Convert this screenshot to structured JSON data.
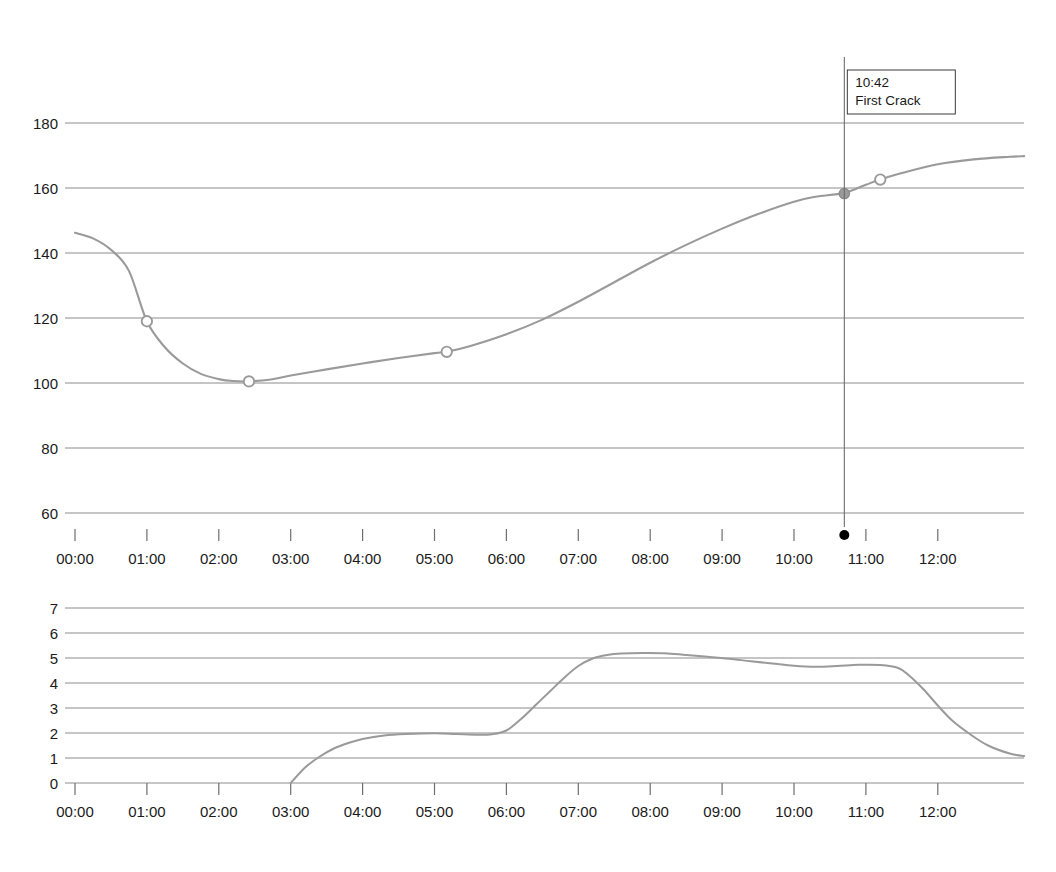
{
  "chart_data": [
    {
      "id": "bean-temperature",
      "type": "line",
      "title": "",
      "xlabel": "",
      "ylabel": "",
      "xlim": [
        0,
        13.2
      ],
      "ylim": [
        55,
        186
      ],
      "yticks": [
        60,
        80,
        100,
        120,
        140,
        160,
        180
      ],
      "ytick_labels": [
        "60",
        "80",
        "100",
        "120",
        "140",
        "160",
        "180"
      ],
      "xticks": [
        0,
        1,
        2,
        3,
        4,
        5,
        6,
        7,
        8,
        9,
        10,
        11,
        12
      ],
      "xtick_labels": [
        "00:00",
        "01:00",
        "02:00",
        "03:00",
        "04:00",
        "05:00",
        "06:00",
        "07:00",
        "08:00",
        "09:00",
        "10:00",
        "11:00",
        "12:00"
      ],
      "grid": true,
      "line_color": "#9a9a9a",
      "series": [
        {
          "name": "Bean Temperature",
          "x": [
            0.0,
            0.25,
            0.5,
            0.75,
            1.0,
            1.25,
            1.5,
            1.75,
            2.0,
            2.2,
            2.42,
            2.7,
            3.0,
            3.5,
            4.0,
            4.5,
            5.0,
            5.17,
            5.5,
            6.0,
            6.5,
            7.0,
            7.5,
            8.0,
            8.5,
            9.0,
            9.5,
            10.0,
            10.3,
            10.7,
            11.0,
            11.2,
            11.5,
            12.0,
            12.5,
            13.0,
            13.2
          ],
          "y": [
            146.2,
            144.5,
            141.0,
            134.5,
            119.0,
            111.0,
            106.0,
            102.8,
            101.2,
            100.6,
            100.5,
            101.0,
            102.3,
            104.2,
            106.0,
            107.7,
            109.2,
            109.6,
            111.4,
            115.0,
            119.5,
            125.0,
            131.0,
            137.0,
            142.5,
            147.5,
            152.0,
            155.8,
            157.3,
            158.5,
            161.0,
            162.6,
            164.6,
            167.3,
            168.8,
            169.6,
            169.8
          ]
        }
      ],
      "markers": [
        {
          "name": "dry-end-marker",
          "x": 1.0,
          "y": 119.0,
          "style": "open-circle"
        },
        {
          "name": "turning-point-marker",
          "x": 2.42,
          "y": 100.5,
          "style": "open-circle"
        },
        {
          "name": "mid-marker",
          "x": 5.17,
          "y": 109.6,
          "style": "open-circle"
        },
        {
          "name": "first-crack-marker",
          "x": 10.7,
          "y": 158.3,
          "style": "filled-circle"
        },
        {
          "name": "post-crack-marker",
          "x": 11.2,
          "y": 162.6,
          "style": "open-circle"
        }
      ],
      "annotations": [
        {
          "name": "first-crack-annotation",
          "time_label": "10:42",
          "event_label": "First Crack",
          "x": 10.7,
          "axis_dot": true
        }
      ]
    },
    {
      "id": "rate-of-rise",
      "type": "line",
      "title": "",
      "xlabel": "",
      "ylabel": "",
      "xlim": [
        0,
        13.2
      ],
      "ylim": [
        0,
        7
      ],
      "yticks": [
        0,
        1,
        2,
        3,
        4,
        5,
        6,
        7
      ],
      "ytick_labels": [
        "0",
        "1",
        "2",
        "3",
        "4",
        "5",
        "6",
        "7"
      ],
      "xticks": [
        0,
        1,
        2,
        3,
        4,
        5,
        6,
        7,
        8,
        9,
        10,
        11,
        12
      ],
      "xtick_labels": [
        "00:00",
        "01:00",
        "02:00",
        "03:00",
        "04:00",
        "05:00",
        "06:00",
        "07:00",
        "08:00",
        "09:00",
        "10:00",
        "11:00",
        "12:00"
      ],
      "grid": true,
      "line_color": "#9a9a9a",
      "series": [
        {
          "name": "Rate of Rise",
          "x": [
            3.0,
            3.2,
            3.4,
            3.6,
            3.8,
            4.0,
            4.3,
            4.6,
            5.0,
            5.3,
            5.6,
            5.8,
            6.0,
            6.2,
            6.4,
            6.6,
            6.8,
            7.0,
            7.2,
            7.4,
            7.6,
            7.9,
            8.2,
            8.5,
            8.8,
            9.1,
            9.4,
            9.7,
            10.0,
            10.3,
            10.6,
            10.9,
            11.2,
            11.45,
            11.6,
            11.8,
            12.0,
            12.2,
            12.45,
            12.7,
            13.0,
            13.2
          ],
          "y": [
            0.0,
            0.62,
            1.05,
            1.38,
            1.6,
            1.76,
            1.9,
            1.96,
            1.99,
            1.96,
            1.93,
            1.95,
            2.1,
            2.55,
            3.1,
            3.65,
            4.2,
            4.68,
            4.98,
            5.12,
            5.18,
            5.2,
            5.19,
            5.12,
            5.05,
            4.97,
            4.87,
            4.78,
            4.69,
            4.65,
            4.68,
            4.73,
            4.72,
            4.6,
            4.3,
            3.75,
            3.1,
            2.5,
            1.95,
            1.5,
            1.18,
            1.08
          ]
        }
      ],
      "markers": [],
      "annotations": []
    }
  ]
}
